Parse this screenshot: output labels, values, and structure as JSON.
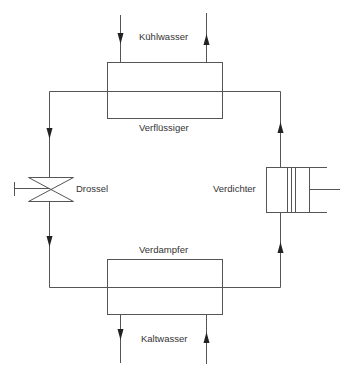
{
  "diagram": {
    "components": {
      "condenser": {
        "label": "Verflüssiger"
      },
      "evaporator": {
        "label": "Verdampfer"
      },
      "throttle": {
        "label": "Drossel"
      },
      "compressor": {
        "label": "Verdichter"
      }
    },
    "streams": {
      "cooling_water": {
        "label": "Kühlwasser"
      },
      "cold_water": {
        "label": "Kaltwasser"
      }
    },
    "colors": {
      "line": "#555555",
      "text": "#333333",
      "background": "#ffffff"
    }
  }
}
